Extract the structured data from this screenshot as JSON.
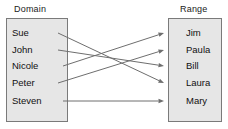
{
  "diagram": {
    "title": "",
    "type": "mapping-diagram",
    "colors": {
      "box_fill": "#e6e6e6",
      "box_border": "#7a7a7a",
      "arrow": "#6e6e6e",
      "text": "#111111",
      "background": "#ffffff"
    }
  },
  "domain": {
    "label": "Domain",
    "members": [
      {
        "name": "Sue",
        "y": 33
      },
      {
        "name": "John",
        "y": 50
      },
      {
        "name": "Nicole",
        "y": 66
      },
      {
        "name": "Peter",
        "y": 83
      },
      {
        "name": "Steven",
        "y": 101
      }
    ]
  },
  "range": {
    "label": "Range",
    "members": [
      {
        "name": "Jim",
        "y": 33
      },
      {
        "name": "Paula",
        "y": 50
      },
      {
        "name": "Bill",
        "y": 66
      },
      {
        "name": "Laura",
        "y": 83
      },
      {
        "name": "Mary",
        "y": 101
      }
    ]
  },
  "mappings": [
    {
      "from": "Sue",
      "to": "Laura",
      "from_y": 33,
      "to_y": 83,
      "x1": 58,
      "x2": 164
    },
    {
      "from": "John",
      "to": "Bill",
      "from_y": 50,
      "to_y": 66,
      "x1": 58,
      "x2": 164
    },
    {
      "from": "Nicole",
      "to": "Jim",
      "from_y": 66,
      "to_y": 33,
      "x1": 63,
      "x2": 164
    },
    {
      "from": "Peter",
      "to": "Paula",
      "from_y": 83,
      "to_y": 50,
      "x1": 58,
      "x2": 164
    },
    {
      "from": "Steven",
      "to": "Mary",
      "from_y": 101,
      "to_y": 101,
      "x1": 63,
      "x2": 164
    }
  ]
}
